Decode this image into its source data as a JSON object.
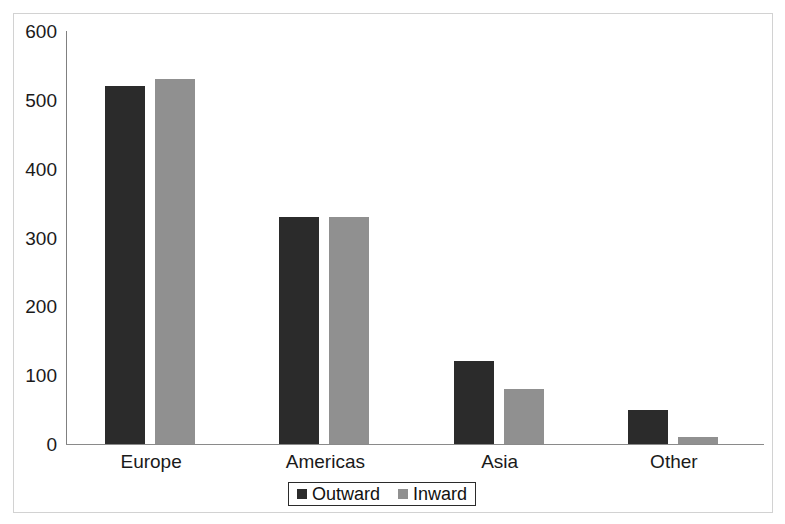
{
  "chart_data": {
    "type": "bar",
    "title": "",
    "subtitle": "",
    "xlabel": "",
    "ylabel": "",
    "categories": [
      "Europe",
      "Americas",
      "Asia",
      "Other"
    ],
    "series": [
      {
        "name": "Outward",
        "color": "#2b2b2b",
        "values": [
          520,
          330,
          120,
          50
        ]
      },
      {
        "name": "Inward",
        "color": "#909090",
        "values": [
          530,
          330,
          80,
          10
        ]
      }
    ],
    "ylim": [
      0,
      600
    ],
    "ytick_labels": [
      "600",
      "500",
      "400",
      "300",
      "200",
      "100",
      "0"
    ],
    "ytick_values": [
      600,
      500,
      400,
      300,
      200,
      100,
      0
    ],
    "grid": false,
    "legend_position": "bottom-center",
    "legend_entries": [
      "Outward",
      "Inward"
    ]
  },
  "axes": {
    "y_axis_name": "y-axis",
    "x_axis_name": "x-axis"
  }
}
